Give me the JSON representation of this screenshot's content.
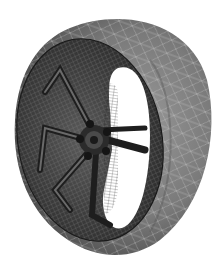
{
  "image": {
    "subject": "wireframe-mesh-car-wheel-with-tire",
    "caption_fragment": "",
    "colors": {
      "background": "#ffffff",
      "tire_light": "#8c8c8c",
      "tire_mid": "#6e6e6e",
      "tire_dark": "#3a3a3a",
      "rim_dark": "#2a2a2a",
      "mesh_line": "#d8d8d8",
      "rim_mesh_line": "#9a9a9a"
    },
    "components": [
      "tire",
      "rim-barrel",
      "five-spokes",
      "hub",
      "lug-nuts",
      "inner-opening"
    ]
  }
}
